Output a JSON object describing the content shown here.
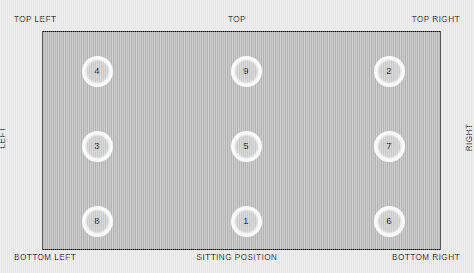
{
  "diagram": {
    "colors": {
      "background": "#e9e9e9",
      "map_fill": "#b9b9b9",
      "map_border": "#141414",
      "seat_fill": "#ffffff",
      "text": "#111111"
    },
    "edge_labels": {
      "top_left": "TOP LEFT",
      "top": "TOP",
      "top_right": "TOP RIGHT",
      "left": "LEFT",
      "right": "RIGHT",
      "bottom_left": "BOTTOM LEFT",
      "bottom": "SITTING POSITION",
      "bottom_right": "BOTTOM RIGHT"
    },
    "grid": {
      "rows": 3,
      "columns": 3,
      "seats": [
        {
          "label": "4",
          "row": 0,
          "col": 0,
          "x": 96,
          "y": 70
        },
        {
          "label": "9",
          "row": 0,
          "col": 1,
          "x": 245,
          "y": 70
        },
        {
          "label": "2",
          "row": 0,
          "col": 2,
          "x": 388,
          "y": 70
        },
        {
          "label": "3",
          "row": 1,
          "col": 0,
          "x": 96,
          "y": 145
        },
        {
          "label": "5",
          "row": 1,
          "col": 1,
          "x": 245,
          "y": 145
        },
        {
          "label": "7",
          "row": 1,
          "col": 2,
          "x": 388,
          "y": 145
        },
        {
          "label": "8",
          "row": 2,
          "col": 0,
          "x": 96,
          "y": 220
        },
        {
          "label": "1",
          "row": 2,
          "col": 1,
          "x": 245,
          "y": 220
        },
        {
          "label": "6",
          "row": 2,
          "col": 2,
          "x": 388,
          "y": 220
        }
      ]
    }
  }
}
